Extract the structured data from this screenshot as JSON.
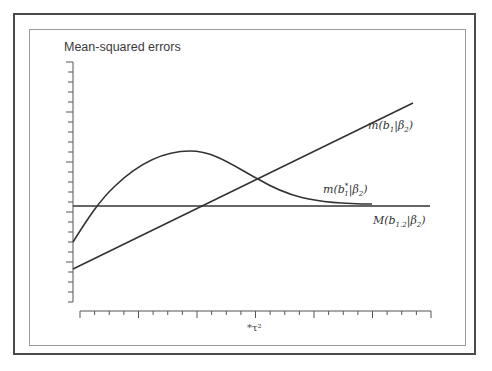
{
  "chart_data": {
    "type": "line",
    "title": "Mean-squared errors",
    "xlabel": "*τ²",
    "ylabel": "",
    "grid": false,
    "legend": "inline labels at right end of curves",
    "x_axis": {
      "ticks": 24,
      "tick_labels": []
    },
    "y_axis": {
      "ticks": 25,
      "tick_labels": []
    },
    "series": [
      {
        "name": "m(b1|β2)",
        "shape": "straight increasing line",
        "x": [
          0,
          1
        ],
        "y": [
          -0.62,
          1.0
        ]
      },
      {
        "name": "m(b1*|β2)",
        "shape": "hump: rises from below zero, peaks, then decays toward the constant line",
        "x": [
          0.0,
          0.09,
          0.2,
          0.33,
          0.45,
          0.55,
          0.7,
          0.88
        ],
        "y": [
          -0.35,
          0.0,
          0.34,
          0.54,
          0.45,
          0.26,
          0.1,
          0.02
        ]
      },
      {
        "name": "M(b1.2|β2)",
        "shape": "horizontal constant line",
        "x": [
          0,
          1
        ],
        "y": [
          0,
          0
        ]
      }
    ]
  },
  "labels": {
    "title": "Mean-squared errors",
    "series_1": {
      "main": "m(b",
      "sub": "1",
      "rest": "|β",
      "sub2": "2",
      "close": ")"
    },
    "series_2": {
      "main": "m(b",
      "sup": "*",
      "sub": "1",
      "rest": "|β",
      "sub2": "2",
      "close": ")"
    },
    "series_3": {
      "main": "M(b",
      "sub": "1.2",
      "rest": "|β",
      "sub2": "2",
      "close": ")"
    },
    "x_axis": "*τ²"
  }
}
